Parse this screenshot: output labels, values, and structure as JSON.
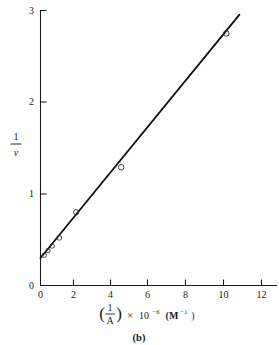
{
  "figure": {
    "caption": "(b)",
    "plot_type": "scatter-with-fit-line"
  },
  "axes": {
    "x": {
      "label_parts": {
        "frac_numerator": "1",
        "frac_denominator": "A",
        "times": "×",
        "base": "10",
        "exponent": "−6",
        "units_open": "(M",
        "units_exponent": "−1",
        "units_close": ")"
      },
      "label_plain": "(1/A) × 10^-6 (M^-1)",
      "ticks": [
        "0",
        "2",
        "4",
        "6",
        "8",
        "10",
        "12"
      ],
      "tick_values": [
        0,
        2,
        4,
        6,
        8,
        10,
        12
      ],
      "range": [
        0,
        12.6
      ]
    },
    "y": {
      "label_parts": {
        "frac_numerator": "1",
        "frac_denominator": "v"
      },
      "label_plain": "1/v",
      "ticks": [
        "0",
        "1",
        "2",
        "3"
      ],
      "tick_values": [
        0,
        1,
        2,
        3
      ],
      "range": [
        0,
        3
      ]
    }
  },
  "chart_data": {
    "type": "scatter",
    "title": "",
    "subtitle": "",
    "xlabel": "(1/A) × 10^-6 (M^-1)",
    "ylabel": "1/v",
    "xlim": [
      0,
      12.6
    ],
    "ylim": [
      0,
      3
    ],
    "xticks": [
      0,
      2,
      4,
      6,
      8,
      10,
      12
    ],
    "yticks": [
      0,
      1,
      2,
      3
    ],
    "grid": false,
    "legend": "none",
    "annotations": [
      "(b)"
    ],
    "series": [
      {
        "name": "observed",
        "marker": "open-circle",
        "points": [
          {
            "x": 0.2,
            "y": 0.33
          },
          {
            "x": 0.4,
            "y": 0.38
          },
          {
            "x": 0.62,
            "y": 0.43
          },
          {
            "x": 1.0,
            "y": 0.52
          },
          {
            "x": 1.9,
            "y": 0.8
          },
          {
            "x": 4.3,
            "y": 1.29
          },
          {
            "x": 9.9,
            "y": 2.75
          }
        ]
      },
      {
        "name": "linear-fit",
        "marker": "none",
        "line": {
          "intercept": 0.3,
          "slope": 0.2505,
          "x_start": 0.0,
          "x_end": 10.6,
          "y_start": 0.3,
          "y_end": 2.955
        }
      }
    ]
  }
}
